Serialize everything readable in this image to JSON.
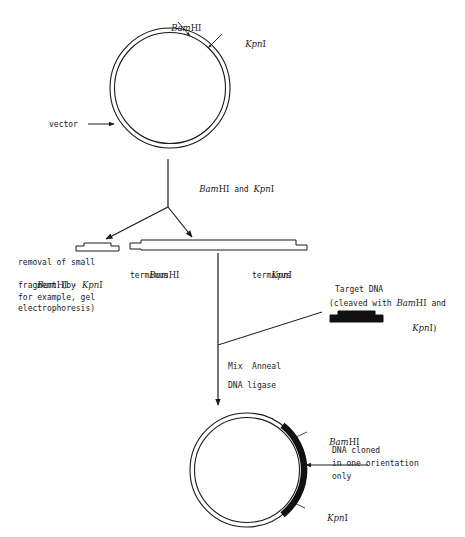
{
  "diagram": {
    "type": "molecular-cloning-flow",
    "background_color": "#ffffff",
    "line_color": "#1a1a1a",
    "insert_color": "#111111"
  },
  "top_plasmid": {
    "name": "vector-plasmid",
    "vector_label": "vector",
    "sites": [
      {
        "id": "bamhi",
        "italic": "Bam",
        "upright": "HI",
        "full": "BamHI"
      },
      {
        "id": "kpni",
        "italic": "Kpn",
        "upright": "I",
        "full": "KpnI"
      }
    ]
  },
  "digest_step": {
    "name": "restriction-digest",
    "label_italic_1": "Bam",
    "label_upright_1": "HI",
    "label_and": " and ",
    "label_italic_2": "Kpn",
    "label_upright_2": "I",
    "full": "BamHI and KpnI"
  },
  "small_fragment": {
    "name": "small-fragment-removal",
    "caption_lines": [
      "removal of small",
      "fragment (by",
      "for example, gel",
      "electrophoresis)"
    ],
    "line2_italic_1": "Bam",
    "line2_upright_1": "HI",
    "line2_dash": " - ",
    "line2_italic_2": "Kpn",
    "line2_upright_2": "I"
  },
  "linear_vector": {
    "name": "linearized-vector",
    "left_terminus_italic": "Bam",
    "left_terminus_upright": "HI",
    "left_terminus_word": "terminus",
    "right_terminus_italic": "Kpn",
    "right_terminus_upright": "I",
    "right_terminus_word": "terminus"
  },
  "target_dna": {
    "name": "target-dna",
    "title": "Target DNA",
    "line2_prefix": "(cleaved with ",
    "line2_italic": "Bam",
    "line2_upright": "HI",
    "line2_suffix": " and",
    "line3_italic": "Kpn",
    "line3_upright": "I)"
  },
  "ligation_step": {
    "name": "ligation-step",
    "line1": "Mix  Anneal",
    "line2": "DNA ligase"
  },
  "bottom_plasmid": {
    "name": "recombinant-plasmid",
    "sites": [
      {
        "id": "bamhi",
        "italic": "Bam",
        "upright": "HI",
        "full": "BamHI"
      },
      {
        "id": "kpni",
        "italic": "Kpn",
        "upright": "I",
        "full": "KpnI"
      }
    ],
    "callout_lines": [
      "DNA cloned",
      "in one orientation",
      "only"
    ]
  }
}
